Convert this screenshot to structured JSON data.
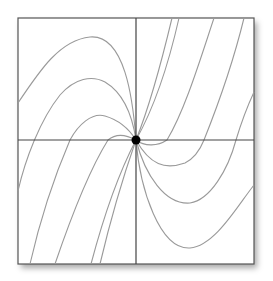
{
  "diagram": {
    "type": "phase-portrait",
    "frame": {
      "x": 18,
      "y": 18,
      "width": 236,
      "height": 246,
      "stroke": "#555555",
      "fill": "#ffffff"
    },
    "axes": {
      "origin": {
        "x": 136,
        "y": 140
      },
      "stroke": "#444444"
    },
    "equilibrium": {
      "x": 136,
      "y": 140,
      "r": 4.5,
      "fill": "#000000",
      "label": "node"
    },
    "trajectory_color": "#9a9a9a",
    "trajectories": [
      {
        "id": "ul-outer",
        "d": "M18,103 C40,70 60,40 90,37 C125,34 133,100 136,140"
      },
      {
        "id": "ul-2",
        "d": "M18,191 C25,160 40,120 60,95 C75,78 92,75 105,82 C125,94 133,120 136,140"
      },
      {
        "id": "ul-3",
        "d": "M30,264 C40,220 55,175 70,140 C78,125 92,112 105,116 C122,121 131,132 136,140"
      },
      {
        "id": "ul-4",
        "d": "M55,264 C70,220 88,172 108,140 C115,134 125,134 136,140"
      },
      {
        "id": "ll-1",
        "d": "M91,264 C100,230 115,180 136,140"
      },
      {
        "id": "ll-2",
        "d": "M100,264 C108,230 122,180 136,140"
      },
      {
        "id": "ur-1",
        "d": "M136,140 C150,105 162,60 172,18"
      },
      {
        "id": "ur-2",
        "d": "M136,140 C150,115 165,80 179,18"
      },
      {
        "id": "lr-1",
        "d": "M136,140 C145,147 158,146 167,140 C185,110 200,60 214,18"
      },
      {
        "id": "lr-2",
        "d": "M136,140 C150,165 165,170 185,163 C195,158 200,150 204,140 C220,100 235,55 244,18"
      },
      {
        "id": "lr-3",
        "d": "M136,140 C145,175 165,205 190,203 C210,200 228,170 236,140 C242,120 248,105 254,92"
      },
      {
        "id": "lr-4",
        "d": "M136,140 C140,190 160,250 190,248 C215,246 238,205 254,185"
      }
    ]
  }
}
